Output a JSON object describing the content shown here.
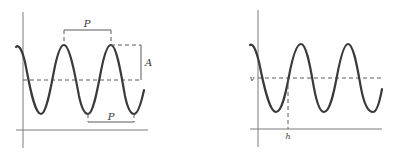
{
  "figures": [
    {
      "id": "left",
      "description": "Sinusoidal wave with period P and amplitude A",
      "labels": {
        "period_top": "P",
        "period_bottom": "P",
        "amplitude": "A"
      }
    },
    {
      "id": "right",
      "description": "Sinusoidal wave with midline value v and horizontal shift h",
      "labels": {
        "midline": "v",
        "shift": "h"
      }
    }
  ],
  "colors": {
    "curve": "#3a3a3a",
    "dashed": "#5a5a5a",
    "axis": "#7a7a7a"
  }
}
